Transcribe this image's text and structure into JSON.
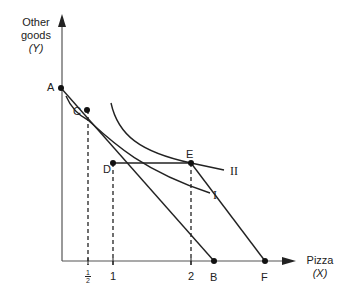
{
  "diagram": {
    "y_axis": {
      "title_line1": "Other",
      "title_line2": "goods",
      "title_line3": "(Y)"
    },
    "x_axis": {
      "title_line1": "Pizza",
      "title_line2": "(X)"
    },
    "points": {
      "A": "A",
      "B": "B",
      "C": "C",
      "D": "D",
      "E": "E",
      "F": "F"
    },
    "curves": {
      "I": "I",
      "II": "II"
    },
    "x_ticks": {
      "half_num": "1",
      "half_den": "2",
      "one": "1",
      "two": "2"
    },
    "colors": {
      "line": "#222222",
      "background": "#ffffff"
    }
  }
}
